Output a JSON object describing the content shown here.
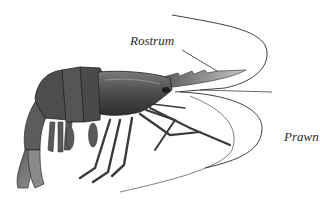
{
  "diagram": {
    "subject": "Prawn",
    "labels": [
      {
        "id": "rostrum",
        "text": "Rostrum"
      },
      {
        "id": "species",
        "text": "Prawn"
      }
    ],
    "colors": {
      "background": "#ffffff",
      "body_dark": "#3f3f3f",
      "body_mid": "#6b6b6b",
      "body_light": "#a8a8a8",
      "line": "#2a2a2a"
    }
  }
}
